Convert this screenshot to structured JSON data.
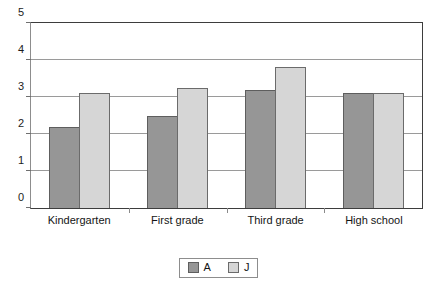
{
  "chart_data": {
    "type": "bar",
    "title": "",
    "subtitle": "",
    "xlabel": "",
    "ylabel": "",
    "categories": [
      "Kindergarten",
      "First grade",
      "Third grade",
      "High school"
    ],
    "series": [
      {
        "name": "A",
        "color": "#969696",
        "values": [
          2.2,
          2.5,
          3.2,
          3.1
        ]
      },
      {
        "name": "J",
        "color": "#d6d6d6",
        "values": [
          3.1,
          3.25,
          3.8,
          3.1
        ]
      }
    ],
    "ylim": [
      0,
      5
    ],
    "ytick_labels": [
      "5",
      "4",
      "3",
      "2",
      "1",
      "0"
    ],
    "ytick_values": [
      5,
      4,
      3,
      2,
      1,
      0
    ],
    "grid": "horizontal",
    "legend_position": "bottom-center",
    "annotations": []
  },
  "legend": {
    "items": [
      {
        "label": "A",
        "swatch": "legend-swatch-a"
      },
      {
        "label": "J",
        "swatch": "legend-swatch-j"
      }
    ]
  }
}
